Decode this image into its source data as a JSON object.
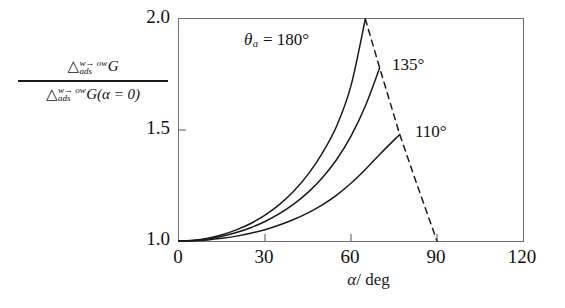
{
  "figure": {
    "background": "#ffffff",
    "frame_color": "#6f6f6f",
    "curve_color": "#1a1a1a"
  },
  "yaxis": {
    "numerator": {
      "delta": "△",
      "superscript": "w→ ow",
      "subscript": "ads",
      "symbol": "G"
    },
    "denominator": {
      "delta": "△",
      "superscript": "w→ ow",
      "subscript": "ads",
      "symbol": "G(α = 0)"
    },
    "ticks": [
      "2.0",
      "1.5",
      "1.0"
    ]
  },
  "xaxis": {
    "title_symbol": "α",
    "title_unit": "/ deg",
    "ticks": [
      "0",
      "30",
      "60",
      "90",
      "120"
    ]
  },
  "annotations": [
    {
      "name": "theta-180",
      "theta": "θ",
      "sub": "a",
      "text": "= 180°"
    },
    {
      "name": "theta-135",
      "text": "135°"
    },
    {
      "name": "theta-110",
      "text": "110°"
    }
  ],
  "chart_data": {
    "type": "line",
    "title": "",
    "xlabel": "α / deg",
    "ylabel": "△(w→ow)_ads G / △(w→ow)_ads G(α = 0)",
    "xlim": [
      0,
      120
    ],
    "ylim": [
      1.0,
      2.0
    ],
    "xticks": [
      0,
      30,
      60,
      90,
      120
    ],
    "yticks": [
      1.0,
      1.5,
      2.0
    ],
    "grid": false,
    "legend": "inline-annotations",
    "series": [
      {
        "name": "theta_a = 180°",
        "style": "solid",
        "x": [
          0,
          5,
          10,
          15,
          20,
          25,
          30,
          35,
          40,
          45,
          50,
          55,
          60,
          65
        ],
        "y": [
          1.0,
          1.003,
          1.012,
          1.028,
          1.05,
          1.079,
          1.117,
          1.164,
          1.224,
          1.3,
          1.396,
          1.518,
          1.7,
          2.0
        ]
      },
      {
        "name": "135°",
        "style": "solid",
        "x": [
          0,
          5,
          10,
          15,
          20,
          25,
          30,
          35,
          40,
          45,
          50,
          55,
          60,
          65,
          70
        ],
        "y": [
          1.0,
          1.002,
          1.009,
          1.021,
          1.038,
          1.06,
          1.088,
          1.123,
          1.166,
          1.219,
          1.285,
          1.367,
          1.472,
          1.608,
          1.78
        ]
      },
      {
        "name": "110°",
        "style": "solid",
        "x": [
          0,
          5,
          10,
          15,
          20,
          25,
          30,
          35,
          40,
          45,
          50,
          55,
          60,
          65,
          70,
          77
        ],
        "y": [
          1.0,
          1.001,
          1.005,
          1.012,
          1.022,
          1.035,
          1.051,
          1.072,
          1.097,
          1.127,
          1.163,
          1.207,
          1.26,
          1.322,
          1.39,
          1.48
        ]
      },
      {
        "name": "envelope",
        "style": "dashed",
        "x": [
          65,
          70,
          77,
          83,
          90
        ],
        "y": [
          2.0,
          1.78,
          1.48,
          1.255,
          1.0
        ]
      }
    ]
  }
}
